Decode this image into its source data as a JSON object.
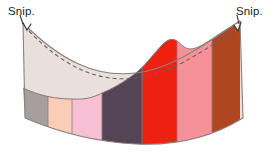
{
  "figure": {
    "type": "sewing-diagram",
    "title_visible": false,
    "background_color": "#ffffff"
  },
  "annotations": {
    "left": {
      "text": "Snip.",
      "color": "#241f1f"
    },
    "right": {
      "text": "Snip.",
      "color": "#241f1f"
    }
  },
  "outline": {
    "stroke_color": "#8a8080",
    "stroke_width": 1.1,
    "dashed_stitch_color": "#6b6060",
    "dash_pattern": "4 3"
  },
  "upper_panel": {
    "name": "waistband-facing",
    "fill": "#e9e0dc",
    "stroke": "#8a8080"
  },
  "bands": [
    {
      "name": "band-gray",
      "fill": "#a79ea0",
      "x_start": 23,
      "x_end": 48
    },
    {
      "name": "band-peach",
      "fill": "#fbcdb7",
      "x_start": 48,
      "x_end": 72
    },
    {
      "name": "band-pink",
      "fill": "#f7bfd4",
      "x_start": 72,
      "x_end": 102
    },
    {
      "name": "band-plum",
      "fill": "#554455",
      "x_start": 102,
      "x_end": 142
    },
    {
      "name": "band-red",
      "fill": "#ee2111",
      "x_start": 142,
      "x_end": 177
    },
    {
      "name": "band-salmon",
      "fill": "#f79198",
      "x_start": 177,
      "x_end": 212
    },
    {
      "name": "band-rust",
      "fill": "#b04620",
      "x_start": 212,
      "x_end": 240
    }
  ],
  "markers": {
    "left_snip_notch": "v-notch",
    "right_snip_notch": "v-notch"
  }
}
